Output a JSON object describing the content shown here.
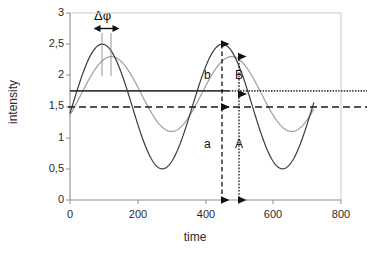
{
  "chart_data": {
    "type": "line",
    "title": "",
    "xlabel": "time",
    "ylabel": "intensity",
    "xlim": [
      0,
      800
    ],
    "ylim": [
      0,
      3
    ],
    "xticks": [
      "0",
      "200",
      "400",
      "600",
      "800"
    ],
    "xtick_values": [
      0,
      200,
      400,
      600,
      800
    ],
    "yticks": [
      "0",
      "0,5",
      "1",
      "1,5",
      "2",
      "2,5",
      "3"
    ],
    "ytick_values": [
      0,
      0.5,
      1,
      1.5,
      2,
      2.5,
      3
    ],
    "grid": false,
    "legend": "none",
    "series": [
      {
        "name": "reference-signal",
        "color": "#3b3b3b",
        "style": "solid-thin",
        "form": "sinusoid",
        "mean": 1.5,
        "amplitude": 1.0,
        "period": 355,
        "peak_time": 95,
        "t_start": 0,
        "t_end": 720,
        "description": "dark sinusoid, peaks 2,5 at t=95 and t=450, troughs 0,5 at t=272 and t=628"
      },
      {
        "name": "phase-shifted-signal",
        "color": "#9e9e9e",
        "style": "solid-thin",
        "form": "sinusoid",
        "mean": 1.7,
        "amplitude": 0.6,
        "period": 355,
        "peak_time": 122,
        "t_start": 0,
        "t_end": 720,
        "description": "light grey sinusoid, smaller amplitude, shifted right by the phase difference"
      }
    ],
    "reference_lines": [
      {
        "name": "dotted-mean-line",
        "orientation": "horizontal",
        "value": 1.75,
        "style": "dotted",
        "color": "#3b3b3b",
        "label": ""
      },
      {
        "name": "dashed-mean-line",
        "orientation": "horizontal",
        "value": 1.5,
        "style": "dashed",
        "color": "#1a1a1a",
        "label": ""
      }
    ],
    "annotations": [
      {
        "name": "phase-shift",
        "label": "Δφ",
        "type": "horizontal-double-arrow",
        "x_from": 95,
        "x_to": 122,
        "y": 2.72
      },
      {
        "name": "amplitude-b",
        "label": "b",
        "type": "vertical-double-arrow-dashed",
        "x": 450,
        "y_from": 1.5,
        "y_to": 2.5
      },
      {
        "name": "offset-a",
        "label": "a",
        "type": "vertical-double-arrow-dashed",
        "x": 450,
        "y_from": 0,
        "y_to": 1.5
      },
      {
        "name": "amplitude-B",
        "label": "B",
        "type": "vertical-double-arrow-dotted",
        "x": 500,
        "y_from": 1.7,
        "y_to": 2.3
      },
      {
        "name": "offset-A",
        "label": "A",
        "type": "vertical-double-arrow-dotted",
        "x": 500,
        "y_from": 0,
        "y_to": 1.7
      }
    ]
  },
  "axes": {
    "ylabel_title": "intensity",
    "xlabel_title": "time",
    "ytick_labels": [
      "3",
      "2,5",
      "2",
      "1,5",
      "1",
      "0,5",
      "0"
    ],
    "xtick_labels": [
      "0",
      "200",
      "400",
      "600",
      "800"
    ]
  },
  "annotation_labels": {
    "delta_phi": "Δφ",
    "b": "b",
    "a": "a",
    "B": "B",
    "A": "A"
  },
  "colors": {
    "dark_curve": "#3b3b3b",
    "grey_curve": "#9e9e9e",
    "axis": "#9a9a9a",
    "text": "#2b2b2b",
    "annotation": "#111111"
  }
}
